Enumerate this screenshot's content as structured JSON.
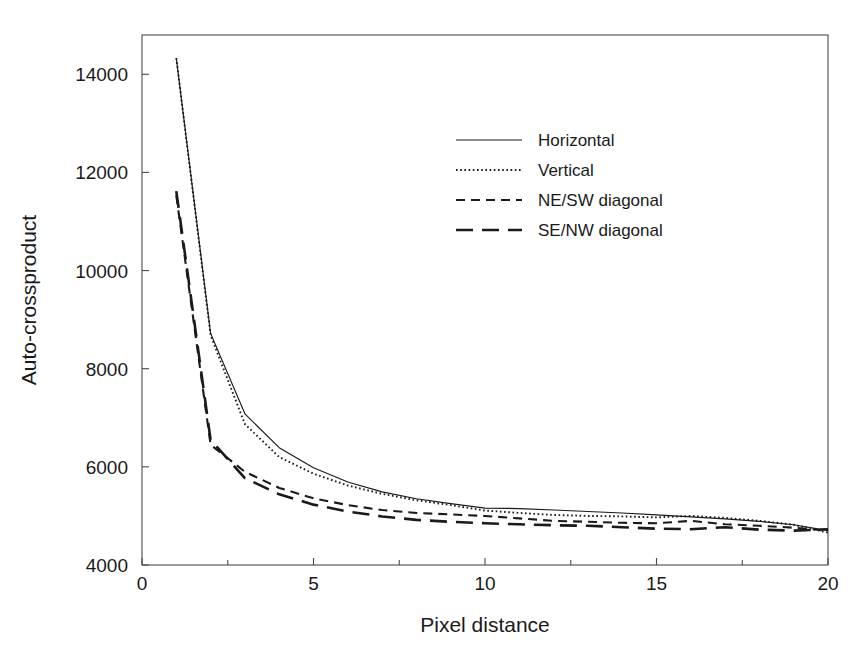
{
  "chart_data": {
    "type": "line",
    "title": "",
    "xlabel": "Pixel distance",
    "ylabel": "Auto-crossproduct",
    "xlim": [
      0,
      20
    ],
    "ylim": [
      4000,
      14800
    ],
    "xticks": [
      0,
      5,
      10,
      15,
      20
    ],
    "xtick_labels": [
      "0",
      "5",
      "10",
      "15",
      "20"
    ],
    "xminorticks": [
      2.5,
      7.5,
      12.5,
      17.5
    ],
    "yticks": [
      4000,
      6000,
      8000,
      10000,
      12000,
      14000
    ],
    "ytick_labels": [
      "4000",
      "6000",
      "8000",
      "10000",
      "12000",
      "14000"
    ],
    "grid": false,
    "legend_position": "upper-right-inside",
    "x": [
      1,
      2,
      3,
      4,
      5,
      6,
      7,
      8,
      9,
      10,
      11,
      12,
      13,
      14,
      15,
      16,
      17,
      18,
      19,
      20
    ],
    "series": [
      {
        "name": "Horizontal",
        "style": "solid",
        "values": [
          14330,
          8720,
          7080,
          6390,
          5980,
          5690,
          5490,
          5350,
          5250,
          5160,
          5150,
          5120,
          5090,
          5060,
          5020,
          4980,
          4940,
          4890,
          4820,
          4700
        ]
      },
      {
        "name": "Vertical",
        "style": "dotted",
        "values": [
          14330,
          8680,
          6870,
          6200,
          5860,
          5620,
          5450,
          5320,
          5220,
          5110,
          5060,
          5020,
          5000,
          4990,
          4970,
          5000,
          4960,
          4900,
          4820,
          4660
        ]
      },
      {
        "name": "NE/SW diagonal",
        "style": "dashed-short",
        "values": [
          11530,
          6450,
          5900,
          5570,
          5360,
          5220,
          5120,
          5060,
          5030,
          5000,
          4950,
          4900,
          4880,
          4860,
          4850,
          4900,
          4830,
          4800,
          4760,
          4700
        ]
      },
      {
        "name": "SE/NW diagonal",
        "style": "dashed-long",
        "values": [
          11620,
          6550,
          5770,
          5440,
          5230,
          5090,
          4990,
          4920,
          4880,
          4850,
          4830,
          4810,
          4800,
          4770,
          4740,
          4730,
          4770,
          4720,
          4700,
          4730
        ]
      }
    ]
  },
  "legend": {
    "entries": [
      {
        "label": "Horizontal"
      },
      {
        "label": "Vertical"
      },
      {
        "label": "NE/SW diagonal"
      },
      {
        "label": "SE/NW diagonal"
      }
    ]
  },
  "colors": {
    "line": "#1a1a1a",
    "axis": "#4a4a4a",
    "background": "#ffffff"
  }
}
